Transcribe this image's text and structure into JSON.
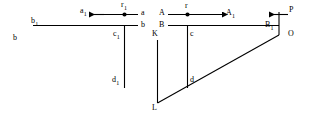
{
  "figure": {
    "type": "geometry-diagram",
    "width": 312,
    "height": 124,
    "background_color": "#ffffff",
    "stroke_color": "#000000",
    "labels": {
      "b_outer": "b",
      "b_sub1": "b",
      "b_sub1_index": "1",
      "a_sub1": "a",
      "a_sub1_index": "1",
      "r_sub1": "r",
      "r_sub1_index": "1",
      "a_right": "a",
      "b_right": "b",
      "c_sub1": "c",
      "c_sub1_index": "1",
      "d_sub1": "d",
      "d_sub1_index": "1",
      "A_left": "A",
      "B_left": "B",
      "r_plain": "r",
      "A_sub1": "A",
      "A_sub1_index": "1",
      "B_sub1": "B",
      "B_sub1_index": "1",
      "P": "P",
      "O": "O",
      "K": "K",
      "L": "L",
      "c_plain": "c",
      "d_plain": "d"
    }
  }
}
